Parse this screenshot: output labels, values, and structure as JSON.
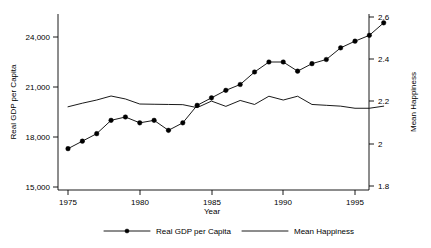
{
  "chart_data": {
    "type": "line",
    "title": "",
    "xlabel": "Year",
    "ylabel": "Real GDP per Capita",
    "y2label": "Mean Happiness",
    "xlim": [
      1974.0,
      1997.8
    ],
    "ylim": [
      15000,
      24900
    ],
    "y2lim": [
      1.78,
      2.62
    ],
    "grid": false,
    "legend_position": "bottom",
    "x_ticks": [
      1975,
      1980,
      1985,
      1990,
      1995
    ],
    "x_tick_labels": [
      "1975",
      "1980",
      "1985",
      "1990",
      "1995"
    ],
    "y_ticks": [
      15000,
      18000,
      21000,
      24000
    ],
    "y_tick_labels": [
      "15,000",
      "18,000",
      "21,000",
      "24,000"
    ],
    "y2_ticks": [
      1.8,
      2.0,
      2.2,
      2.4,
      2.6
    ],
    "y2_tick_labels": [
      "1.8",
      "2",
      "2.2",
      "2.4",
      "2.6"
    ],
    "x": [
      1975,
      1976,
      1977,
      1978,
      1979,
      1980,
      1981,
      1982,
      1983,
      1984,
      1985,
      1986,
      1987,
      1988,
      1989,
      1990,
      1991,
      1992,
      1993,
      1994,
      1995,
      1996,
      1997
    ],
    "series": [
      {
        "name": "Real GDP per Capita",
        "axis": "left",
        "marker": "filled-circle",
        "values": [
          17300,
          17750,
          18200,
          19000,
          19200,
          18850,
          19000,
          18400,
          18850,
          19900,
          20350,
          20800,
          21150,
          21900,
          22500,
          22500,
          21950,
          22400,
          22650,
          23350,
          23750,
          24100,
          24850
        ]
      },
      {
        "name": "Mean Happiness",
        "axis": "right",
        "marker": "none",
        "values": [
          2.175,
          2.192,
          2.207,
          2.226,
          2.212,
          2.188,
          2.187,
          2.186,
          2.185,
          2.171,
          2.202,
          2.177,
          2.205,
          2.186,
          2.225,
          2.207,
          2.225,
          2.186,
          2.182,
          2.178,
          2.168,
          2.168,
          2.178
        ]
      }
    ],
    "legend": [
      {
        "label": "Real GDP per Capita",
        "marker": "filled-circle",
        "line": true
      },
      {
        "label": "Mean Happiness",
        "marker": "none",
        "line": true
      }
    ],
    "colors": {
      "line": "#000000",
      "background": "#ffffff",
      "text": "#000000"
    }
  }
}
